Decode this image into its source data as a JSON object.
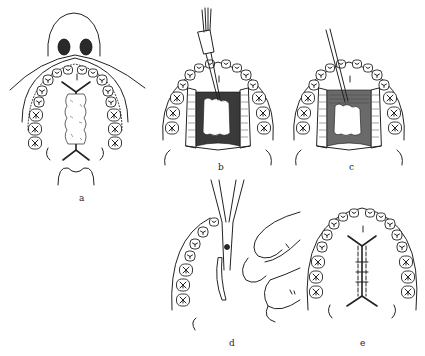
{
  "figure": {
    "panels": [
      {
        "id": "a",
        "label": "a",
        "x": 81,
        "y": 193
      },
      {
        "id": "b",
        "label": "b",
        "x": 220,
        "y": 162
      },
      {
        "id": "c",
        "label": "c",
        "x": 351,
        "y": 162
      },
      {
        "id": "d",
        "label": "d",
        "x": 231,
        "y": 338
      },
      {
        "id": "e",
        "label": "e",
        "x": 362,
        "y": 338
      }
    ]
  },
  "colors": {
    "ink": "#222222",
    "background": "#ffffff",
    "shade": "#2a2a2a"
  }
}
